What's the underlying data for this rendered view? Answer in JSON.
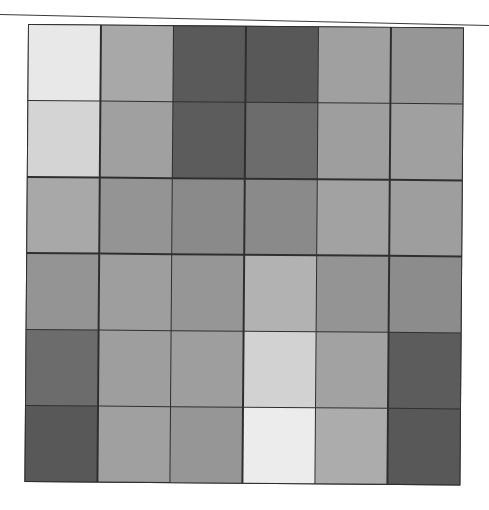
{
  "figure": {
    "rows": 6,
    "cols": 6,
    "border_color": "#2f2f2f",
    "cells": [
      [
        "#e8e8e8",
        "#a8a8a8",
        "#5a5a5a",
        "#585858",
        "#a0a0a0",
        "#969696"
      ],
      [
        "#d4d4d4",
        "#a0a0a0",
        "#5c5c5c",
        "#6c6c6c",
        "#9e9e9e",
        "#a0a0a0"
      ],
      [
        "#a8a8a8",
        "#949494",
        "#8a8a8a",
        "#8a8a8a",
        "#a2a2a2",
        "#9e9e9e"
      ],
      [
        "#949494",
        "#9e9e9e",
        "#969696",
        "#b2b2b2",
        "#949494",
        "#8c8c8c"
      ],
      [
        "#6c6c6c",
        "#9e9e9e",
        "#9e9e9e",
        "#d2d2d2",
        "#a2a2a2",
        "#5c5c5c"
      ],
      [
        "#585858",
        "#a0a0a0",
        "#969696",
        "#ececec",
        "#acacac",
        "#585858"
      ]
    ]
  },
  "chart_data": {
    "type": "heatmap",
    "title": "",
    "xlabel": "",
    "ylabel": "",
    "rows": 6,
    "cols": 6,
    "values": [
      [
        232,
        168,
        90,
        88,
        160,
        150
      ],
      [
        212,
        160,
        92,
        108,
        158,
        160
      ],
      [
        168,
        148,
        138,
        138,
        162,
        158
      ],
      [
        148,
        158,
        150,
        178,
        148,
        140
      ],
      [
        108,
        158,
        158,
        210,
        162,
        92
      ],
      [
        88,
        160,
        150,
        236,
        172,
        88
      ]
    ],
    "value_scale": "grayscale intensity 0-255 (estimated)",
    "grid": true,
    "legend": null
  }
}
